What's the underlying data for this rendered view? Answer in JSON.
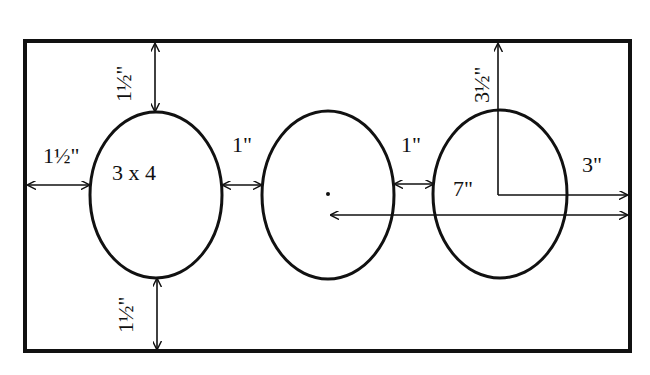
{
  "diagram": {
    "colors": {
      "stroke": "#111111",
      "background": "#ffffff"
    },
    "border": {
      "x": 25,
      "y": 41,
      "width": 605,
      "height": 310
    },
    "ovals": [
      {
        "id": "oval-1",
        "cx": 156,
        "cy": 195,
        "rx": 66,
        "ry": 83,
        "label": "3 x 4"
      },
      {
        "id": "oval-2",
        "cx": 328,
        "cy": 195,
        "rx": 66,
        "ry": 84,
        "label": ""
      },
      {
        "id": "oval-3",
        "cx": 500,
        "cy": 194,
        "rx": 67,
        "ry": 84,
        "label": ""
      }
    ],
    "labels": {
      "top_margin": "1½\"",
      "left_margin": "1½\"",
      "bottom_margin": "1½\"",
      "gap_1": "1\"",
      "gap_2": "1\"",
      "oval_size": "3 x 4",
      "center_height": "3½\"",
      "center_to_edge": "3\"",
      "dot_to_edge": "7\""
    }
  }
}
